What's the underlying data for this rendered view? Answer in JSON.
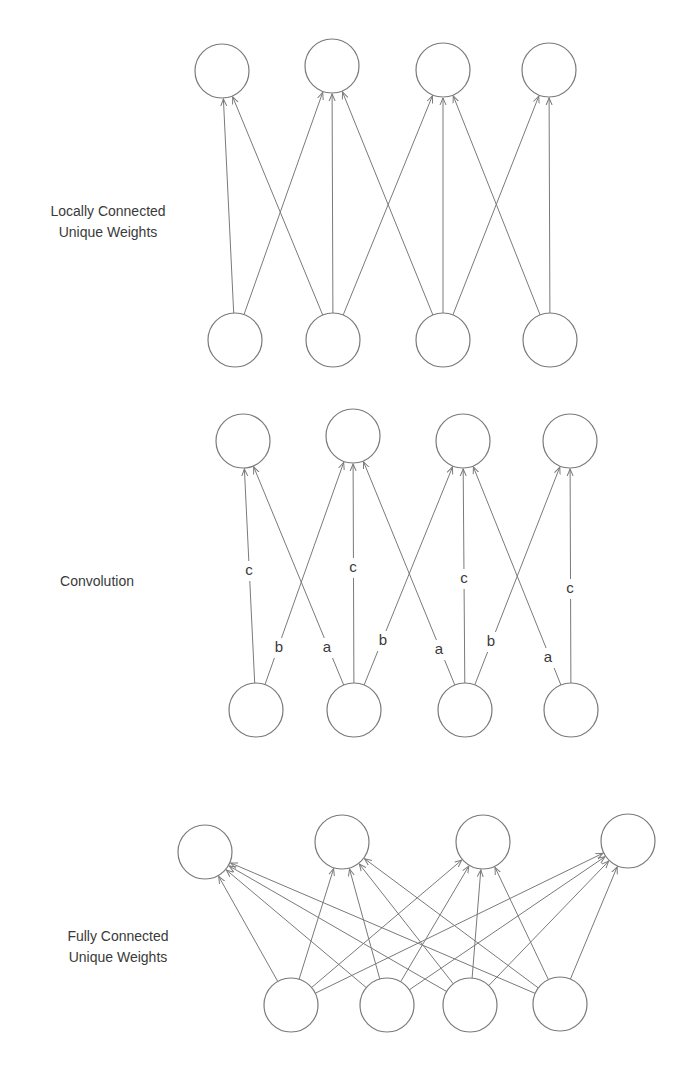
{
  "colors": {
    "stroke": "#7a7a7a",
    "text": "#3a3a3a",
    "background": "#ffffff"
  },
  "node_radius": 27,
  "sections": [
    {
      "id": "locally-connected",
      "label_lines": [
        "Locally Connected",
        "Unique Weights"
      ],
      "label_center": [
        108,
        222
      ],
      "top_nodes": [
        [
          222,
          71
        ],
        [
          332,
          66
        ],
        [
          443,
          70
        ],
        [
          549,
          70
        ]
      ],
      "bottom_nodes": [
        [
          235,
          340
        ],
        [
          333,
          340
        ],
        [
          443,
          340
        ],
        [
          550,
          340
        ]
      ],
      "edges": [
        [
          0,
          0
        ],
        [
          0,
          1
        ],
        [
          1,
          0
        ],
        [
          1,
          1
        ],
        [
          1,
          2
        ],
        [
          2,
          1
        ],
        [
          2,
          2
        ],
        [
          2,
          3
        ],
        [
          3,
          2
        ],
        [
          3,
          3
        ]
      ],
      "edge_labels": []
    },
    {
      "id": "convolution",
      "label_lines": [
        "Convolution"
      ],
      "label_center": [
        97,
        581
      ],
      "top_nodes": [
        [
          243,
          441
        ],
        [
          353,
          436
        ],
        [
          463,
          441
        ],
        [
          570,
          441
        ]
      ],
      "bottom_nodes": [
        [
          256,
          710
        ],
        [
          354,
          710
        ],
        [
          465,
          710
        ],
        [
          571,
          710
        ]
      ],
      "edges": [
        [
          0,
          0
        ],
        [
          1,
          0
        ],
        [
          0,
          1
        ],
        [
          1,
          1
        ],
        [
          2,
          1
        ],
        [
          1,
          2
        ],
        [
          2,
          2
        ],
        [
          3,
          2
        ],
        [
          2,
          3
        ],
        [
          3,
          3
        ]
      ],
      "edge_labels": [
        {
          "text": "c",
          "x": 249,
          "y": 575
        },
        {
          "text": "b",
          "x": 279,
          "y": 652
        },
        {
          "text": "a",
          "x": 327,
          "y": 652
        },
        {
          "text": "c",
          "x": 353,
          "y": 572
        },
        {
          "text": "b",
          "x": 383,
          "y": 645
        },
        {
          "text": "a",
          "x": 439,
          "y": 654
        },
        {
          "text": "c",
          "x": 464,
          "y": 583
        },
        {
          "text": "b",
          "x": 491,
          "y": 646
        },
        {
          "text": "a",
          "x": 548,
          "y": 662
        },
        {
          "text": "c",
          "x": 570,
          "y": 593
        }
      ]
    },
    {
      "id": "fully-connected",
      "label_lines": [
        "Fully Connected",
        "Unique Weights"
      ],
      "label_center": [
        118,
        947
      ],
      "top_nodes": [
        [
          205,
          852
        ],
        [
          342,
          842
        ],
        [
          483,
          842
        ],
        [
          628,
          841
        ]
      ],
      "bottom_nodes": [
        [
          291,
          1005
        ],
        [
          387,
          1005
        ],
        [
          470,
          1005
        ],
        [
          560,
          1004
        ]
      ],
      "edges": [
        [
          0,
          0
        ],
        [
          0,
          1
        ],
        [
          0,
          2
        ],
        [
          0,
          3
        ],
        [
          1,
          0
        ],
        [
          1,
          1
        ],
        [
          1,
          2
        ],
        [
          1,
          3
        ],
        [
          2,
          0
        ],
        [
          2,
          1
        ],
        [
          2,
          2
        ],
        [
          2,
          3
        ],
        [
          3,
          0
        ],
        [
          3,
          1
        ],
        [
          3,
          2
        ],
        [
          3,
          3
        ]
      ],
      "edge_labels": []
    }
  ]
}
